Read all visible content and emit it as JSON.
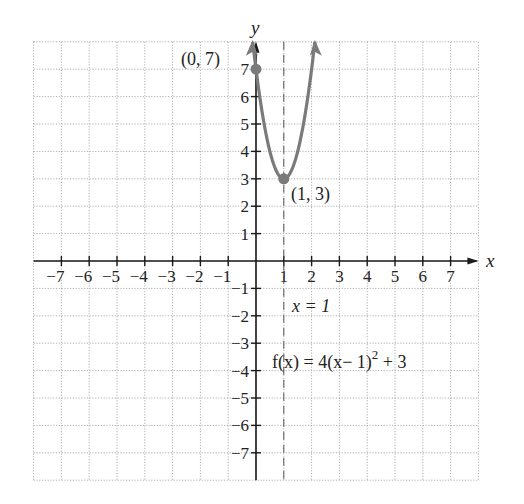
{
  "chart_data": {
    "type": "line",
    "title": "",
    "xlabel": "x",
    "ylabel": "y",
    "xlim": [
      -8,
      8
    ],
    "ylim": [
      -8,
      8
    ],
    "grid": true,
    "x_ticks": [
      -7,
      -6,
      -5,
      -4,
      -3,
      -2,
      -1,
      1,
      2,
      3,
      4,
      5,
      6,
      7
    ],
    "y_ticks": [
      -7,
      -6,
      -5,
      -4,
      -3,
      -2,
      -1,
      1,
      2,
      3,
      4,
      5,
      6,
      7
    ],
    "series": [
      {
        "name": "f(x) = 4(x - 1)^2 + 3",
        "function": "4*(x-1)^2+3",
        "color": "#7a7a7a",
        "x_domain": [
          -0.118,
          2.118
        ],
        "points": [
          [
            -0.118,
            8
          ],
          [
            0,
            7
          ],
          [
            0.5,
            4
          ],
          [
            1,
            3
          ],
          [
            1.5,
            4
          ],
          [
            2,
            7
          ],
          [
            2.118,
            8
          ]
        ]
      }
    ],
    "marked_points": [
      {
        "x": 0,
        "y": 7,
        "label": "(0, 7)"
      },
      {
        "x": 1,
        "y": 3,
        "label": "(1, 3)"
      }
    ],
    "asymptote_lines": [
      {
        "type": "vertical-dashed",
        "x": 1,
        "label": "x = 1"
      }
    ],
    "annotations": [
      {
        "text": "f(x) = 4(x− 1)",
        "superscript": "2",
        "suffix": " + 3"
      }
    ]
  },
  "labels": {
    "x_axis": "x",
    "y_axis": "y",
    "point_a": "(0,  7)",
    "point_b": "(1,  3)",
    "axis_of_symmetry": "x = 1",
    "function_main": "f(x) = 4(x− 1)",
    "function_exp": "2",
    "function_tail": " + 3"
  },
  "colors": {
    "curve": "#7a7a7a",
    "axis": "#1a1a1a",
    "grid": "#9a9a9a"
  }
}
